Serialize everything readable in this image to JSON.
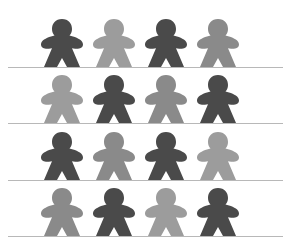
{
  "colors": {
    "dark": "#4a4a4a",
    "medium": "#8a8a8a",
    "light": "#9c9c9c",
    "line": "#b8b8b8",
    "background": "#ffffff"
  },
  "rows": [
    {
      "baseline_y": 67,
      "figures": [
        "dark",
        "light",
        "dark",
        "medium"
      ]
    },
    {
      "baseline_y": 123,
      "figures": [
        "light",
        "dark",
        "medium",
        "dark"
      ]
    },
    {
      "baseline_y": 180,
      "figures": [
        "dark",
        "medium",
        "dark",
        "light"
      ]
    },
    {
      "baseline_y": 236,
      "figures": [
        "medium",
        "dark",
        "light",
        "dark"
      ]
    }
  ],
  "figure_centers_x": [
    62,
    114,
    166,
    218
  ],
  "icon": "meeple-icon"
}
